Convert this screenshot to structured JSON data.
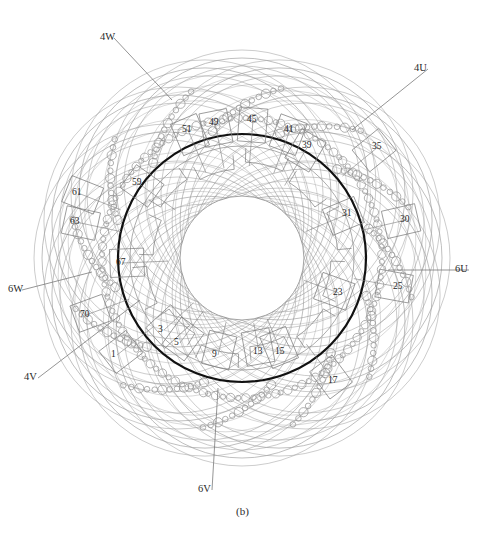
{
  "figure": {
    "caption": "(b)",
    "width": 485,
    "height": 535,
    "background_color": "#ffffff"
  },
  "colors": {
    "core_outline": "#111111",
    "bore_outline": "#8a8a8a",
    "winding_arc": "#9a9a9a",
    "conductor_circle": "#8f8f8f",
    "slot_box": "#7d7d7d",
    "leader_line": "#7a7a7a",
    "text": "#2b2b2b"
  },
  "geometry": {
    "center_x": 242,
    "center_y": 258,
    "core_outer_radius": 124,
    "core_inner_radius": 112,
    "bore_radius": 62,
    "tooth_band_radius": 96,
    "end_winding_max_radius": 198
  },
  "terminals": [
    {
      "id": "4W",
      "label": "4W",
      "x": 100,
      "y": 32,
      "leader_to_x": 172,
      "leader_to_y": 100
    },
    {
      "id": "4U",
      "label": "4U",
      "x": 414,
      "y": 63,
      "leader_to_x": 352,
      "leader_to_y": 130
    },
    {
      "id": "6U",
      "label": "6U",
      "x": 455,
      "y": 264,
      "leader_to_x": 388,
      "leader_to_y": 270
    },
    {
      "id": "6V",
      "label": "6V",
      "x": 198,
      "y": 484,
      "leader_to_x": 218,
      "leader_to_y": 388
    },
    {
      "id": "4V",
      "label": "4V",
      "x": 24,
      "y": 372,
      "leader_to_x": 140,
      "leader_to_y": 300
    },
    {
      "id": "6W",
      "label": "6W",
      "x": 8,
      "y": 284,
      "leader_to_x": 92,
      "leader_to_y": 272
    }
  ],
  "slots": [
    {
      "number": "51",
      "x": 188,
      "y": 130
    },
    {
      "number": "49",
      "x": 215,
      "y": 123
    },
    {
      "number": "45",
      "x": 253,
      "y": 120
    },
    {
      "number": "41",
      "x": 290,
      "y": 130
    },
    {
      "number": "39",
      "x": 308,
      "y": 146
    },
    {
      "number": "35",
      "x": 378,
      "y": 147
    },
    {
      "number": "31",
      "x": 348,
      "y": 214
    },
    {
      "number": "30",
      "x": 406,
      "y": 220
    },
    {
      "number": "25",
      "x": 399,
      "y": 287
    },
    {
      "number": "23",
      "x": 339,
      "y": 293
    },
    {
      "number": "17",
      "x": 334,
      "y": 381
    },
    {
      "number": "15",
      "x": 281,
      "y": 352
    },
    {
      "number": "13",
      "x": 259,
      "y": 352
    },
    {
      "number": "9",
      "x": 218,
      "y": 355
    },
    {
      "number": "5",
      "x": 180,
      "y": 343
    },
    {
      "number": "3",
      "x": 164,
      "y": 330
    },
    {
      "number": "1",
      "x": 117,
      "y": 355
    },
    {
      "number": "70",
      "x": 86,
      "y": 315
    },
    {
      "number": "67",
      "x": 122,
      "y": 263
    },
    {
      "number": "63",
      "x": 76,
      "y": 222
    },
    {
      "number": "61",
      "x": 78,
      "y": 193
    },
    {
      "number": "59",
      "x": 138,
      "y": 183
    }
  ],
  "structure": {
    "core_description": "annular stator core ring",
    "slot_count": 72,
    "phase_groups": 6,
    "end_winding_arc_count": 12,
    "conductor_chain_count": 12
  }
}
